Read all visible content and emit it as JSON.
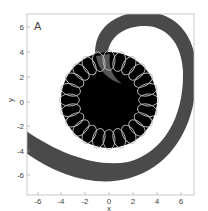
{
  "chart_data": {
    "type": "scatter",
    "title": "",
    "panel_label": "A",
    "xlabel": "x",
    "ylabel": "y",
    "xlim": [
      -7,
      7
    ],
    "ylim": [
      -7,
      7
    ],
    "x_ticks": [
      "-6",
      "-4",
      "-2",
      "0",
      "2",
      "4",
      "6"
    ],
    "y_ticks": [
      "6",
      "4",
      "2",
      "0",
      "-2",
      "-4",
      "-6"
    ],
    "grid": false,
    "legend": null,
    "elements": [
      {
        "name": "spiral-band",
        "shape": "spiral",
        "color": "#4a4a4a",
        "description": "Gray spiral arm starting inside disk near (0,2), looping over top (y~7), down right side (x~6.5), along bottom (y~-5 to -6.5), exiting left edge at y~-3 to -5"
      },
      {
        "name": "central-disk",
        "shape": "circle",
        "center": [
          0,
          0
        ],
        "radius": 4,
        "color": "#000000"
      },
      {
        "name": "orbit-circles",
        "shape": "ring-of-circles",
        "count": 24,
        "ring_radius": 3.3,
        "circle_radius": 0.7,
        "color": "#bbbbbb"
      }
    ]
  },
  "axes": {
    "xlabel": "x",
    "ylabel": "y",
    "panel": "A"
  }
}
